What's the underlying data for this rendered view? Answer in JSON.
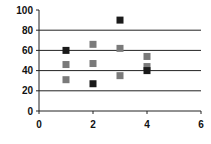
{
  "chart_data": {
    "type": "scatter",
    "title": "",
    "xlabel": "",
    "ylabel": "",
    "xlim": [
      0,
      6
    ],
    "ylim": [
      0,
      100
    ],
    "xticks": [
      0,
      2,
      4,
      6
    ],
    "yticks": [
      0,
      20,
      40,
      60,
      80,
      100
    ],
    "grid": "horizontal",
    "legend": null,
    "series": [
      {
        "name": "dark",
        "color": "#1a1a1a",
        "marker": "square",
        "points": [
          {
            "x": 1,
            "y": 60
          },
          {
            "x": 2,
            "y": 27
          },
          {
            "x": 3,
            "y": 90
          },
          {
            "x": 4,
            "y": 40
          }
        ]
      },
      {
        "name": "gray",
        "color": "#7a7a7a",
        "marker": "square",
        "points": [
          {
            "x": 1,
            "y": 46
          },
          {
            "x": 1,
            "y": 31
          },
          {
            "x": 2,
            "y": 66
          },
          {
            "x": 2,
            "y": 47
          },
          {
            "x": 3,
            "y": 62
          },
          {
            "x": 3,
            "y": 35
          },
          {
            "x": 4,
            "y": 54
          },
          {
            "x": 4,
            "y": 44
          }
        ]
      }
    ]
  }
}
